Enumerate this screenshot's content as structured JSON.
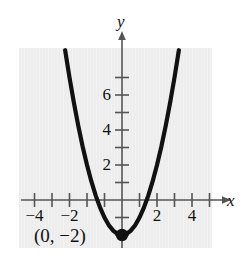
{
  "figure": {
    "part_label": ")",
    "background_color": "#ffffff",
    "panel_color": "#ededed",
    "curve_color": "#111111"
  },
  "axes": {
    "x_axis_name": "x",
    "y_axis_name": "y"
  },
  "annotations": {
    "vertex_label": "(0, −2)"
  },
  "chart_data": {
    "type": "line",
    "title": "",
    "subtitle": "",
    "xlabel": "x",
    "ylabel": "y",
    "equation": "y = x^2 - 2",
    "xlim": [
      -5.0,
      5.2
    ],
    "ylim": [
      -2.9,
      8.5
    ],
    "grid": false,
    "legend": null,
    "x_ticks": [
      -5,
      -4,
      -3,
      -2,
      -1,
      1,
      2,
      3,
      4,
      5
    ],
    "x_tick_labels": [
      "",
      "-4",
      "",
      "-2",
      "",
      "",
      "2",
      "",
      "4",
      ""
    ],
    "x_labeled_ticks": [
      {
        "value": -4,
        "label": "−4"
      },
      {
        "value": -2,
        "label": "−2"
      },
      {
        "value": 2,
        "label": "2"
      },
      {
        "value": 4,
        "label": "4"
      }
    ],
    "y_ticks": [
      -2,
      -1,
      1,
      2,
      3,
      4,
      5,
      6,
      7
    ],
    "y_labeled_ticks": [
      {
        "value": 2,
        "label": "2"
      },
      {
        "value": 4,
        "label": "4"
      },
      {
        "value": 6,
        "label": "6"
      }
    ],
    "series": [
      {
        "name": "y = x^2 - 2",
        "type": "parabola",
        "vertex": [
          0,
          -2
        ],
        "x_intercepts": [
          -1.414,
          1.414
        ],
        "y_intercept": -2,
        "opens": "up",
        "x": [
          -3.25,
          -3.0,
          -2.75,
          -2.5,
          -2.25,
          -2.0,
          -1.75,
          -1.5,
          -1.25,
          -1.0,
          -0.75,
          -0.5,
          -0.25,
          0,
          0.25,
          0.5,
          0.75,
          1.0,
          1.25,
          1.5,
          1.75,
          2.0,
          2.25,
          2.5,
          2.75,
          3.0,
          3.25
        ],
        "y": [
          8.56,
          7.0,
          5.56,
          4.25,
          3.06,
          2.0,
          1.06,
          0.25,
          -0.44,
          -1.0,
          -1.44,
          -1.75,
          -1.94,
          -2.0,
          -1.94,
          -1.75,
          -1.44,
          -1.0,
          -0.44,
          0.25,
          1.06,
          2.0,
          3.06,
          4.25,
          5.56,
          7.0,
          8.56
        ]
      }
    ],
    "points": [
      {
        "label": "(0, −2)",
        "x": 0,
        "y": -2,
        "style": "filled-circle"
      }
    ]
  }
}
